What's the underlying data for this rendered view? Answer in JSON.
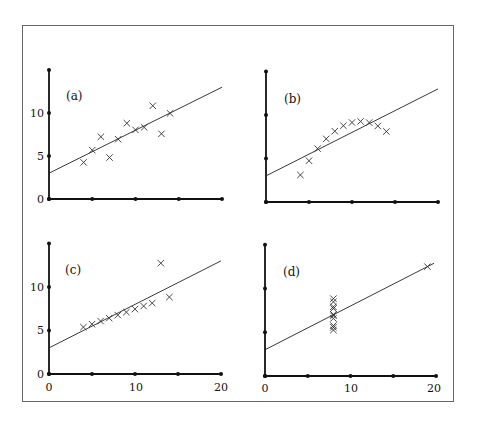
{
  "chart_data": [
    {
      "type": "scatter",
      "title": "(a)",
      "x": [
        10,
        8,
        13,
        9,
        11,
        14,
        6,
        4,
        12,
        7,
        5
      ],
      "y": [
        8.04,
        6.95,
        7.58,
        8.81,
        8.33,
        9.96,
        7.24,
        4.26,
        10.84,
        4.82,
        5.68
      ],
      "fit_line": {
        "intercept": 3,
        "slope": 0.5
      },
      "xlim": [
        0,
        20
      ],
      "ylim": [
        0,
        15
      ],
      "xticks": [
        0,
        5,
        10,
        15,
        20
      ],
      "xtick_labels": [],
      "yticks": [
        0,
        5,
        10,
        15
      ],
      "ytick_labels": [
        "0",
        "5",
        "10"
      ],
      "grid": false,
      "marker": "x"
    },
    {
      "type": "scatter",
      "title": "(b)",
      "x": [
        10,
        8,
        13,
        9,
        11,
        14,
        6,
        4,
        12,
        7,
        5
      ],
      "y": [
        9.14,
        8.14,
        8.74,
        8.77,
        9.26,
        8.1,
        6.13,
        3.1,
        9.13,
        7.26,
        4.74
      ],
      "fit_line": {
        "intercept": 3,
        "slope": 0.5
      },
      "xlim": [
        0,
        20
      ],
      "ylim": [
        0,
        15
      ],
      "xticks": [
        0,
        5,
        10,
        15,
        20
      ],
      "xtick_labels": [],
      "yticks": [
        0,
        5,
        10,
        15
      ],
      "ytick_labels": [],
      "grid": false,
      "marker": "x"
    },
    {
      "type": "scatter",
      "title": "(c)",
      "x": [
        10,
        8,
        13,
        9,
        11,
        14,
        6,
        4,
        12,
        7,
        5
      ],
      "y": [
        7.46,
        6.77,
        12.74,
        7.11,
        7.81,
        8.84,
        6.08,
        5.39,
        8.15,
        6.42,
        5.73
      ],
      "fit_line": {
        "intercept": 3,
        "slope": 0.5
      },
      "xlim": [
        0,
        20
      ],
      "ylim": [
        0,
        15
      ],
      "xticks": [
        0,
        5,
        10,
        15,
        20
      ],
      "xtick_labels": [
        "0",
        "10",
        "20"
      ],
      "yticks": [
        0,
        5,
        10,
        15
      ],
      "ytick_labels": [
        "0",
        "5",
        "10"
      ],
      "grid": false,
      "marker": "x"
    },
    {
      "type": "scatter",
      "title": "(d)",
      "x": [
        8,
        8,
        8,
        8,
        8,
        8,
        8,
        19,
        8,
        8,
        8
      ],
      "y": [
        6.58,
        5.76,
        7.71,
        8.84,
        8.47,
        7.04,
        5.25,
        12.5,
        5.56,
        7.91,
        6.89
      ],
      "fit_line": {
        "intercept": 3,
        "slope": 0.5
      },
      "xlim": [
        0,
        20
      ],
      "ylim": [
        0,
        15
      ],
      "xticks": [
        0,
        5,
        10,
        15,
        20
      ],
      "xtick_labels": [
        "0",
        "10",
        "20"
      ],
      "yticks": [
        0,
        5,
        10,
        15
      ],
      "ytick_labels": [],
      "grid": false,
      "marker": "x"
    }
  ],
  "panels": {
    "a": {
      "label": "(a)"
    },
    "b": {
      "label": "(b)"
    },
    "c": {
      "label": "(c)"
    },
    "d": {
      "label": "(d)"
    }
  },
  "tick_text": {
    "t0": "0",
    "t5": "5",
    "t10": "10",
    "t20": "20"
  }
}
